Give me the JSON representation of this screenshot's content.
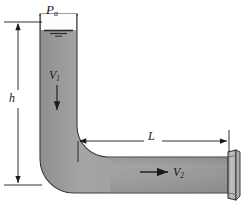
{
  "figure": {
    "type": "engineering-schematic"
  },
  "labels": {
    "pressure_ambient": "P",
    "pressure_ambient_sub": "a",
    "height": "h",
    "velocity_1": "V",
    "velocity_1_sub": "1",
    "length": "L",
    "velocity_2": "V",
    "velocity_2_sub": "2"
  },
  "colors": {
    "pipe_fill": "#9a9a9a",
    "pipe_fill_light": "#b4b4b4",
    "pipe_outline": "#3c3c3c",
    "line": "#1a1a1a",
    "background": "#ffffff",
    "flange_face": "#c9c9c9",
    "flange_edge": "#7d7d7d"
  },
  "geometry": {
    "vertical_pipe_left": 40,
    "vertical_pipe_right": 77,
    "vertical_pipe_top": 14,
    "horizontal_pipe_top": 157,
    "horizontal_pipe_bottom": 193,
    "horizontal_pipe_right": 228,
    "elbow_radius": 34,
    "water_surface_y": 30,
    "dimension_h_x": 18,
    "dimension_h_top": 22,
    "dimension_h_bottom": 185,
    "dimension_l_y": 141,
    "dimension_l_left": 78,
    "dimension_l_right": 229
  },
  "elements": {
    "water_surface_symbol": "free-surface-triple-line",
    "elbow": "rounded-90-degree-bend",
    "discharge_end": "flange",
    "flow_arrow_1_direction": "down",
    "flow_arrow_2_direction": "right"
  }
}
